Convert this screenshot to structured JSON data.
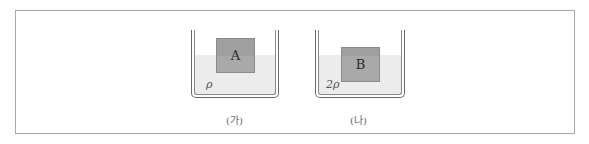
{
  "figure": {
    "panels": [
      {
        "id": "ga",
        "caption": "(가)",
        "block_label": "A",
        "liquid_density_label": "ρ"
      },
      {
        "id": "na",
        "caption": "(나)",
        "block_label": "B",
        "liquid_density_label": "2ρ"
      }
    ],
    "colors": {
      "frame": "#a8a8a8",
      "liquid": "#ececec",
      "block": "#a9a9a9",
      "wall": "#6a6a6a"
    }
  }
}
